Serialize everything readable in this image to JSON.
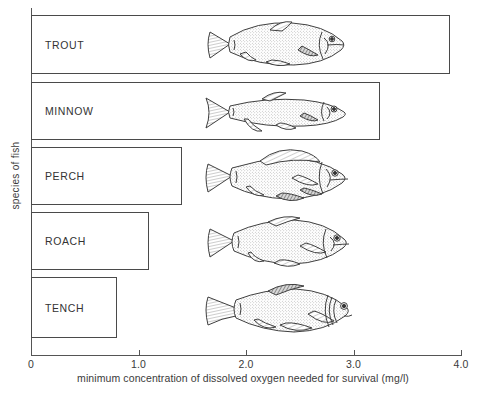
{
  "chart_data": {
    "type": "bar",
    "orientation": "horizontal",
    "title": "",
    "xlabel": "minimum concentration of dissolved oxygen needed for survival (mg/l)",
    "ylabel": "species of fish",
    "categories": [
      "TROUT",
      "MINNOW",
      "PERCH",
      "ROACH",
      "TENCH"
    ],
    "values": [
      3.9,
      3.25,
      1.4,
      1.1,
      0.8
    ],
    "xlim": [
      0,
      4.0
    ],
    "xticks": [
      0,
      1.0,
      2.0,
      3.0,
      4.0
    ],
    "xtick_labels": [
      "0",
      "1.0",
      "2.0",
      "3.0",
      "4.0"
    ],
    "grid": false,
    "legend": "none",
    "bar_fill": "#ffffff",
    "bar_stroke": "#4a4a4a",
    "annotations": [
      {
        "label": "TROUT",
        "icon": "fish-trout-illustration"
      },
      {
        "label": "MINNOW",
        "icon": "fish-minnow-illustration"
      },
      {
        "label": "PERCH",
        "icon": "fish-perch-illustration"
      },
      {
        "label": "ROACH",
        "icon": "fish-roach-illustration"
      },
      {
        "label": "TENCH",
        "icon": "fish-tench-illustration"
      }
    ]
  },
  "axes": {
    "x_title": "minimum concentration of dissolved oxygen needed for survival (mg/l)",
    "y_title": "species of fish",
    "x_ticks": [
      {
        "value": 0,
        "label": "0"
      },
      {
        "value": 1.0,
        "label": "1.0"
      },
      {
        "value": 2.0,
        "label": "2.0"
      },
      {
        "value": 3.0,
        "label": "3.0"
      },
      {
        "value": 4.0,
        "label": "4.0"
      }
    ]
  },
  "bars": [
    {
      "label": "TROUT",
      "value": 3.9,
      "icon": "fish-trout-illustration"
    },
    {
      "label": "MINNOW",
      "value": 3.25,
      "icon": "fish-minnow-illustration"
    },
    {
      "label": "PERCH",
      "value": 1.4,
      "icon": "fish-perch-illustration"
    },
    {
      "label": "ROACH",
      "value": 1.1,
      "icon": "fish-roach-illustration"
    },
    {
      "label": "TENCH",
      "value": 0.8,
      "icon": "fish-tench-illustration"
    }
  ],
  "colors": {
    "bar_stroke": "#4a4a4a",
    "axis": "#555555",
    "text": "#333333",
    "background": "#ffffff"
  }
}
